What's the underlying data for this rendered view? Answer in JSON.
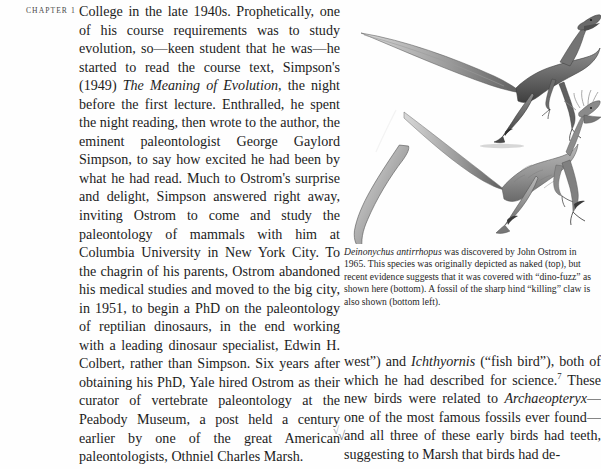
{
  "page": {
    "background_color": "#fefefe",
    "text_color": "#1c1c1c"
  },
  "marginal": {
    "chapter_label": "CHAPTER 1"
  },
  "body_left": {
    "text": "College in the late 1940s. Prophetically, one of his course requirements was to study evolution, so—keen student that he was—he started to read the course text, Simpson's (1949) The Meaning of Evolution, the night before the first lecture. Enthralled, he spent the night reading, then wrote to the author, the eminent paleontologist George Gaylord Simpson, to say how excited he had been by what he had read. Much to Ostrom's surprise and delight, Simpson answered right away, inviting Ostrom to come and study the paleontology of mammals with him at Columbia University in New York City. To the chagrin of his parents, Ostrom abandoned his medical studies and moved to the big city, in 1951, to begin a PhD on the paleontology of reptilian dinosaurs, in the end working with a leading dinosaur specialist, Edwin H. Colbert, rather than Simpson. Six years after obtaining his PhD, Yale hired Ostrom as their curator of vertebrate paleontology at the Peabody Museum, a post held a century earlier by one of the great American paleontologists, Othniel Charles Marsh.",
    "segments": [
      {
        "type": "text",
        "value": "College in the late 1940s. Prophetically, one of his course requirements was to study evolution, so—keen student that he was—he started to read the course text, Simpson's (1949) "
      },
      {
        "type": "italic",
        "value": "The Meaning of Evolution"
      },
      {
        "type": "text",
        "value": ", the night before the first lecture. Enthralled, he spent the night reading, then wrote to the author, the eminent paleontologist George Gaylord Simpson, to say how excited he had been by what he had read. Much to Ostrom's surprise and delight, Simpson answered right away, inviting Ostrom to come and study the paleontology of mammals with him at Columbia University in New York City. To the chagrin of his parents, Ostrom abandoned his medical studies and moved to the big city, in 1951, to begin a PhD on the paleontology of reptilian dinosaurs, in the end working with a leading dinosaur specialist, Edwin H. Colbert, rather than Simpson. Six years after obtaining his PhD, Yale hired Ostrom as their curator of vertebrate paleontology at the Peabody Museum, a post held a century earlier by one of the great American paleontologists, Othniel Charles Marsh."
      }
    ]
  },
  "figure": {
    "alt_name": "deinonychus-illustration",
    "panels": [
      {
        "name": "naked-deinonychus-top",
        "description": "Pen-and-ink drawing of a running Deinonychus depicted without feathers"
      },
      {
        "name": "feathered-deinonychus-bottom",
        "description": "Drawing of a Deinonychus covered in dino-fuzz (filamentous feathers)"
      },
      {
        "name": "sickle-claw-fossil",
        "description": "Fossil of the sharp hind killing claw"
      }
    ]
  },
  "caption": {
    "species": "Deinonychus antirrhopus",
    "rest": " was discovered by John Ostrom in 1965. This species was originally depicted as naked (top), but recent evidence suggests that it was covered with “dino-fuzz” as shown here (bottom). A fossil of the sharp hind “killing” claw is also shown (bottom left).",
    "full_text": "Deinonychus antirrhopus was discovered by John Ostrom in 1965. This species was originally depicted as naked (top), but recent evidence suggests that it was covered with “dino-fuzz” as shown here (bottom). A fossil of the sharp hind “killing” claw is also shown (bottom left)."
  },
  "body_right": {
    "text": "west\") and Ichthyornis (\"fish bird\"), both of which he had described for science.7 These new birds were related to Archaeopteryx—one of the most famous fossils ever found—and all three of these early birds had teeth, suggesting to Marsh that birds had de-",
    "lead": "west”) and ",
    "genus1": "Ichthyornis",
    "mid": " (“fish bird”), both of which he had described for science.",
    "footnote_marker": "7",
    "after_footnote": " These new birds were related to ",
    "genus2": "Archaeopteryx",
    "tail": "—one of the most famous fossils ever found—and all three of these early birds had teeth, suggesting to Marsh that birds had de-"
  },
  "artifacts": {
    "left_mark": "√",
    "right_mark": "√"
  }
}
